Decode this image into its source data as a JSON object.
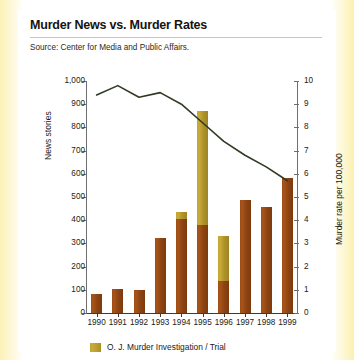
{
  "header": {
    "title": "Murder News vs. Murder Rates",
    "source": "Source: Center for Media and Public Affairs."
  },
  "legend": {
    "oj_label": "O. J. Murder Investigation / Trial",
    "oj_color": "#c0a432",
    "news_color": "#9e4d16",
    "rate_color": "#2f3a22"
  },
  "chart_data": {
    "type": "bar",
    "title": "Murder News vs. Murder Rates",
    "subtitle": "Source: Center for Media and Public Affairs.",
    "xlabel": "",
    "ylabel": "News stories",
    "y2label": "Murder rate per 100,000",
    "ylim": [
      0,
      1000
    ],
    "y2lim": [
      0,
      10
    ],
    "yticks": [
      0,
      100,
      200,
      300,
      400,
      500,
      600,
      700,
      800,
      900,
      1000
    ],
    "ytick_labels": [
      "0",
      "100",
      "200",
      "300",
      "400",
      "500",
      "600",
      "700",
      "800",
      "900",
      "1,000"
    ],
    "y2ticks": [
      0,
      1,
      2,
      3,
      4,
      5,
      6,
      7,
      8,
      9,
      10
    ],
    "y2tick_labels": [
      "0",
      "1",
      "2",
      "3",
      "4",
      "5",
      "6",
      "7",
      "8",
      "9",
      "10"
    ],
    "grid": false,
    "legend_position": "bottom-left",
    "categories": [
      "1990",
      "1991",
      "1992",
      "1993",
      "1994",
      "1995",
      "1996",
      "1997",
      "1998",
      "1999"
    ],
    "series": [
      {
        "name": "News stories",
        "type": "bar",
        "stacked": true,
        "axis": "left",
        "color": "#9e4d16",
        "values": [
          80,
          105,
          100,
          325,
          405,
          380,
          140,
          485,
          455,
          580
        ]
      },
      {
        "name": "O. J. Murder Investigation / Trial",
        "type": "bar",
        "stacked": true,
        "axis": "left",
        "color": "#c0a432",
        "values": [
          0,
          0,
          0,
          0,
          30,
          490,
          190,
          0,
          0,
          0
        ]
      },
      {
        "name": "Murder rate per 100,000",
        "type": "line",
        "axis": "right",
        "color": "#2f3a22",
        "values": [
          9.4,
          9.8,
          9.3,
          9.5,
          9.0,
          8.2,
          7.4,
          6.8,
          6.3,
          5.7
        ]
      }
    ]
  }
}
